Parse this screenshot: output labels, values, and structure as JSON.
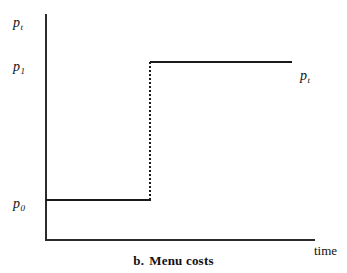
{
  "figure": {
    "caption_label": "b.",
    "caption_title": "Menu costs"
  },
  "axes": {
    "y_axis_label": "p",
    "y_axis_label_sub": "t",
    "x_axis_label": "time"
  },
  "annotations": {
    "level_high_label": "p",
    "level_high_sub": "1",
    "level_low_label": "p",
    "level_low_sub": "0",
    "series_label": "p",
    "series_label_sub": "t"
  },
  "colors": {
    "axis": "#2b2b2b",
    "series": "#1a1a1a",
    "background": "#ffffff",
    "text": "#111111"
  },
  "chart_data": {
    "type": "line",
    "xlabel": "time",
    "ylabel": "p_t",
    "grid": false,
    "legend": "none",
    "xlim": [
      0,
      100
    ],
    "ylim": [
      0,
      100
    ],
    "annotations": [
      {
        "text": "p_t",
        "role": "y-axis-top-label",
        "x": 0,
        "y": 100
      },
      {
        "text": "p_1",
        "role": "y-tick-label",
        "x": 0,
        "y": 79
      },
      {
        "text": "p_0",
        "role": "y-tick-label",
        "x": 0,
        "y": 18
      },
      {
        "text": "p_t",
        "role": "series-label",
        "x": 95,
        "y": 75
      },
      {
        "text": "time",
        "role": "x-axis-label",
        "x": 100,
        "y": 0
      }
    ],
    "series": [
      {
        "name": "p_t",
        "style": "step",
        "description": "price level constant at p_0, then jumps discontinuously to p_1 and stays constant",
        "x": [
          0,
          39,
          39,
          92
        ],
        "values": [
          18,
          18,
          79,
          79
        ],
        "segments": [
          {
            "name": "pre-adjustment",
            "level_label": "p_0",
            "y": 18,
            "x_start": 0,
            "x_end": 39,
            "style": "solid"
          },
          {
            "name": "price-jump",
            "level_label": "p_0 to p_1",
            "x": 39,
            "y_start": 18,
            "y_end": 79,
            "style": "dotted"
          },
          {
            "name": "post-adjustment",
            "level_label": "p_1",
            "y": 79,
            "x_start": 39,
            "x_end": 92,
            "style": "solid"
          }
        ]
      }
    ]
  }
}
